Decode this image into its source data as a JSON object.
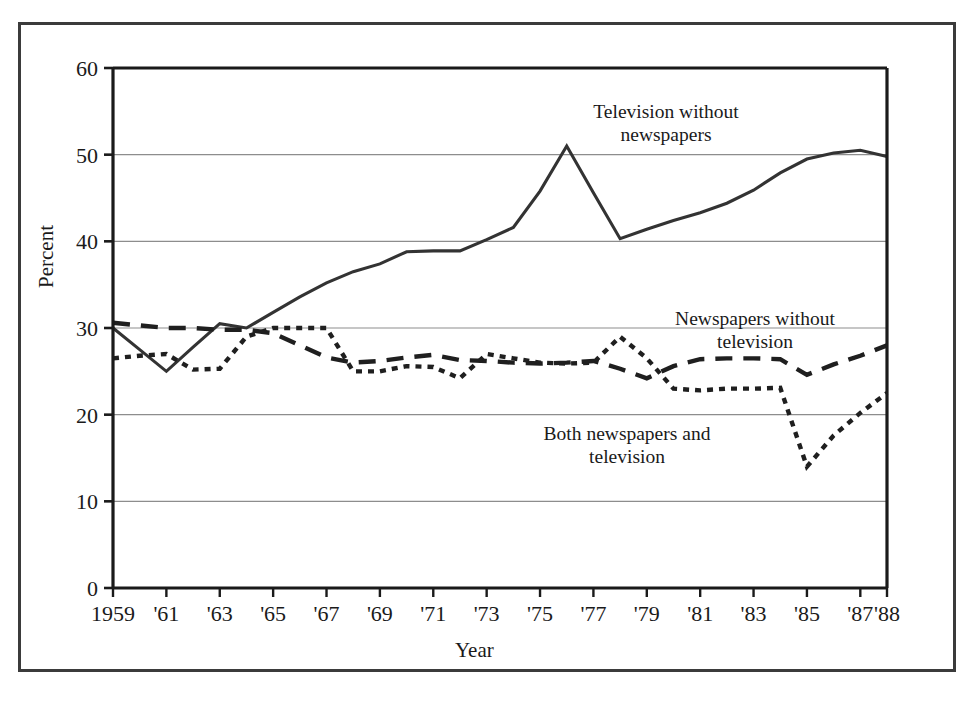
{
  "figure": {
    "border_color": "#3b3b3b",
    "background": "#ffffff"
  },
  "chart_data": {
    "type": "line",
    "title": "",
    "xlabel": "Year",
    "ylabel": "Percent",
    "ylim": [
      0,
      60
    ],
    "yticks": [
      0,
      10,
      20,
      30,
      40,
      50,
      60
    ],
    "ytick_labels": [
      "0",
      "10",
      "20",
      "30",
      "40",
      "50",
      "60"
    ],
    "grid": "horizontal",
    "legend_position": "inline-annotations",
    "x": [
      1959,
      1960,
      1961,
      1962,
      1963,
      1964,
      1965,
      1966,
      1967,
      1968,
      1969,
      1970,
      1971,
      1972,
      1973,
      1974,
      1975,
      1976,
      1977,
      1978,
      1979,
      1980,
      1981,
      1982,
      1983,
      1984,
      1985,
      1986,
      1987,
      1988
    ],
    "xtick_values": [
      1959,
      1961,
      1963,
      1965,
      1967,
      1969,
      1971,
      1973,
      1975,
      1977,
      1979,
      1981,
      1983,
      1985,
      1987,
      1988
    ],
    "xtick_labels": [
      "1959",
      "'61",
      "'63",
      "'65",
      "'67",
      "'69",
      "'71",
      "'73",
      "'75",
      "'77",
      "'79",
      "'81",
      "'83",
      "'85",
      "'87",
      "'88"
    ],
    "series": [
      {
        "name": "Television without newspapers",
        "style": "solid",
        "color": "#333333",
        "annotation": "Television without\nnewspapers",
        "values": [
          30.0,
          27.5,
          25.0,
          27.8,
          30.5,
          30.0,
          31.8,
          33.6,
          35.2,
          36.5,
          37.4,
          38.8,
          38.9,
          38.9,
          40.2,
          41.6,
          45.8,
          51.0,
          45.6,
          40.3,
          41.4,
          42.4,
          43.3,
          44.4,
          45.9,
          47.9,
          49.5,
          50.2,
          50.5,
          49.8
        ]
      },
      {
        "name": "Newspapers without television",
        "style": "dashed",
        "color": "#1f1f1f",
        "annotation": "Newspapers without\ntelevision",
        "values": [
          30.6,
          30.3,
          30.0,
          30.0,
          29.8,
          29.8,
          29.4,
          28.0,
          26.6,
          26.0,
          26.2,
          26.6,
          26.9,
          26.3,
          26.2,
          26.0,
          25.9,
          26.0,
          26.2,
          25.3,
          24.2,
          25.6,
          26.4,
          26.5,
          26.5,
          26.4,
          24.6,
          25.8,
          26.8,
          28.0
        ]
      },
      {
        "name": "Both newspapers and television",
        "style": "dotted",
        "color": "#1f1f1f",
        "annotation": "Both newspapers and\ntelevision",
        "values": [
          26.5,
          26.8,
          27.0,
          25.2,
          25.3,
          29.0,
          30.0,
          30.0,
          30.0,
          25.0,
          25.0,
          25.6,
          25.5,
          24.2,
          27.0,
          26.5,
          26.0,
          25.9,
          26.0,
          29.0,
          26.5,
          23.0,
          22.8,
          23.0,
          23.0,
          23.1,
          14.0,
          17.6,
          20.2,
          22.5
        ]
      }
    ]
  },
  "annotations": {
    "tv_without_newspapers_line1": "Television without",
    "tv_without_newspapers_line2": "newspapers",
    "newspapers_without_tv_line1": "Newspapers without",
    "newspapers_without_tv_line2": "television",
    "both_line1": "Both newspapers and",
    "both_line2": "television"
  },
  "axes": {
    "y_title": "Percent",
    "x_title": "Year"
  }
}
